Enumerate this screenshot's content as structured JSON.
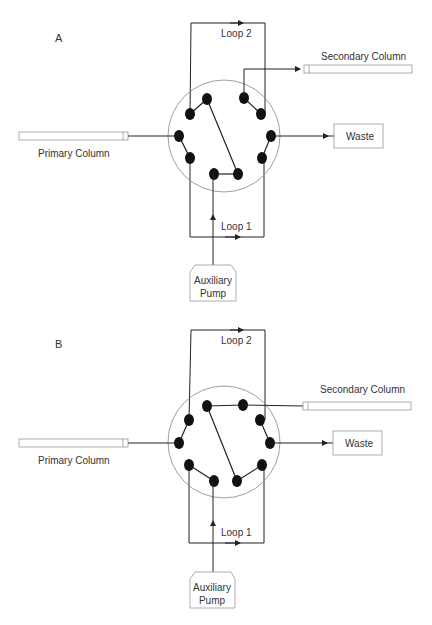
{
  "figure": {
    "panels": [
      {
        "id": "A",
        "label": "A",
        "labels": {
          "loop2": "Loop 2",
          "loop1": "Loop 1",
          "secondary_column": "Secondary Column",
          "primary_column": "Primary Column",
          "waste": "Waste",
          "pump_line1": "Auxiliary",
          "pump_line2": "Pump"
        }
      },
      {
        "id": "B",
        "label": "B",
        "labels": {
          "loop2": "Loop 2",
          "loop1": "Loop 1",
          "secondary_column": "Secondary Column",
          "primary_column": "Primary Column",
          "waste": "Waste",
          "pump_line1": "Auxiliary",
          "pump_line2": "Pump"
        }
      }
    ],
    "colors": {
      "line": "#222222",
      "port": "#111111",
      "valve_outline": "#888888",
      "box_outline": "#999999"
    }
  }
}
